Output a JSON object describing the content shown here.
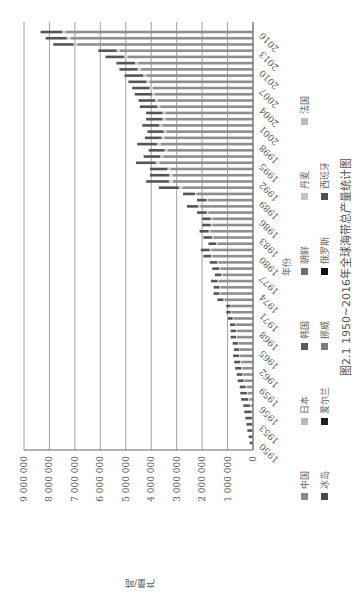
{
  "chart_data": {
    "type": "bar",
    "stacked": true,
    "orientation": "vertical",
    "title": "图2.1 1950~2016年全球海带总产量统计图",
    "xlabel": "年份",
    "ylabel": "产量/吨",
    "ylim": [
      0,
      9000000
    ],
    "yticks": [
      "0",
      "1 000 000",
      "2 000 000",
      "3 000 000",
      "4 000 000",
      "5 000 000",
      "6 000 000",
      "7 000 000",
      "8 000 000",
      "9 000 000"
    ],
    "xtick_labels": [
      "1950",
      "1953",
      "1956",
      "1959",
      "1962",
      "1965",
      "1968",
      "1971",
      "1974",
      "1977",
      "1980",
      "1983",
      "1986",
      "1989",
      "1992",
      "1995",
      "1998",
      "2001",
      "2004",
      "2007",
      "2010",
      "2013",
      "2016"
    ],
    "grid": true,
    "legend_position": "bottom",
    "legend": [
      {
        "name": "中国",
        "color": "#8a8a8a"
      },
      {
        "name": "日本",
        "color": "#b9b9b9"
      },
      {
        "name": "韩国",
        "color": "#5a5a5a"
      },
      {
        "name": "朝鲜",
        "color": "#6e6e6e"
      },
      {
        "name": "丹麦",
        "color": "#c4c4c4"
      },
      {
        "name": "法国",
        "color": "#bdbdbd"
      },
      {
        "name": "冰岛",
        "color": "#4a4a4a"
      },
      {
        "name": "爱尔兰",
        "color": "#1e1e1e"
      },
      {
        "name": "挪威",
        "color": "#7c7c7c"
      },
      {
        "name": "俄罗斯",
        "color": "#141414"
      },
      {
        "name": "西班牙",
        "color": "#505050"
      }
    ],
    "categories": [
      1950,
      1951,
      1952,
      1953,
      1954,
      1955,
      1956,
      1957,
      1958,
      1959,
      1960,
      1961,
      1962,
      1963,
      1964,
      1965,
      1966,
      1967,
      1968,
      1969,
      1970,
      1971,
      1972,
      1973,
      1974,
      1975,
      1976,
      1977,
      1978,
      1979,
      1980,
      1981,
      1982,
      1983,
      1984,
      1985,
      1986,
      1987,
      1988,
      1989,
      1990,
      1991,
      1992,
      1993,
      1994,
      1995,
      1996,
      1997,
      1998,
      1999,
      2000,
      2001,
      2002,
      2003,
      2004,
      2005,
      2006,
      2007,
      2008,
      2009,
      2010,
      2011,
      2012,
      2013,
      2014,
      2015,
      2016
    ],
    "totals": [
      130000,
      170000,
      220000,
      260000,
      300000,
      340000,
      380000,
      470000,
      500000,
      520000,
      600000,
      640000,
      700000,
      740000,
      780000,
      750000,
      800000,
      880000,
      880000,
      900000,
      980000,
      1050000,
      1050000,
      1400000,
      1550000,
      1550000,
      1650000,
      1500000,
      1600000,
      1700000,
      1950000,
      2050000,
      1750000,
      1950000,
      2100000,
      2000000,
      2000000,
      2200000,
      2600000,
      2200000,
      2750000,
      3700000,
      4200000,
      4050000,
      4050000,
      4600000,
      4300000,
      4100000,
      4550000,
      4250000,
      4150000,
      4350000,
      4200000,
      4200000,
      4450000,
      4500000,
      4650000,
      4750000,
      4900000,
      5050000,
      5250000,
      5370000,
      5800000,
      6080000,
      7850000,
      8150000,
      8350000
    ],
    "china_share_approx": [
      0.0,
      0.0,
      0.0,
      0.0,
      0.0,
      0.0,
      0.2,
      0.3,
      0.4,
      0.5,
      0.55,
      0.6,
      0.6,
      0.62,
      0.65,
      0.68,
      0.7,
      0.72,
      0.72,
      0.75,
      0.78,
      0.8,
      0.82,
      0.8,
      0.82,
      0.82,
      0.82,
      0.8,
      0.8,
      0.8,
      0.82,
      0.8,
      0.8,
      0.8,
      0.8,
      0.8,
      0.8,
      0.8,
      0.8,
      0.8,
      0.8,
      0.75,
      0.75,
      0.78,
      0.8,
      0.8,
      0.82,
      0.82,
      0.8,
      0.82,
      0.82,
      0.82,
      0.82,
      0.82,
      0.82,
      0.83,
      0.83,
      0.83,
      0.83,
      0.83,
      0.84,
      0.84,
      0.85,
      0.86,
      0.88,
      0.88,
      0.88
    ]
  }
}
